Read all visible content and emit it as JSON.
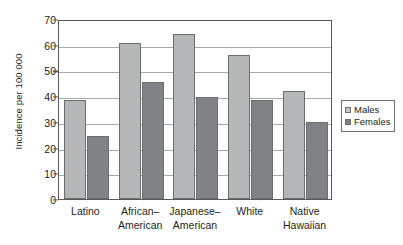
{
  "chart_data": {
    "type": "bar",
    "title": "",
    "xlabel": "",
    "ylabel": "Incidence per 100 000",
    "ylim": [
      0,
      70
    ],
    "ytick_step": 10,
    "yticks": [
      0,
      10,
      20,
      30,
      40,
      50,
      60,
      70
    ],
    "ytick_labels": [
      "0",
      "10",
      "20",
      "30",
      "40",
      "50",
      "60",
      "70"
    ],
    "grid": true,
    "grid_axis": "y",
    "legend_position": "right",
    "categories": [
      "Latino",
      "African–American",
      "Japanese–American",
      "White",
      "Native Hawaiian"
    ],
    "category_lines": [
      [
        "Latino"
      ],
      [
        "African–",
        "American"
      ],
      [
        "Japanese–",
        "American"
      ],
      [
        "White"
      ],
      [
        "Native",
        "Hawaiian"
      ]
    ],
    "series": [
      {
        "name": "Males",
        "color": "#b6b7b9",
        "values": [
          38.5,
          60.5,
          64.0,
          56.0,
          42.0
        ]
      },
      {
        "name": "Females",
        "color": "#808285",
        "values": [
          24.5,
          45.5,
          39.5,
          38.5,
          30.0
        ]
      }
    ]
  },
  "legend": {
    "items": [
      {
        "label": "Males",
        "swatch": "males-swatch"
      },
      {
        "label": "Females",
        "swatch": "females-swatch"
      }
    ]
  }
}
